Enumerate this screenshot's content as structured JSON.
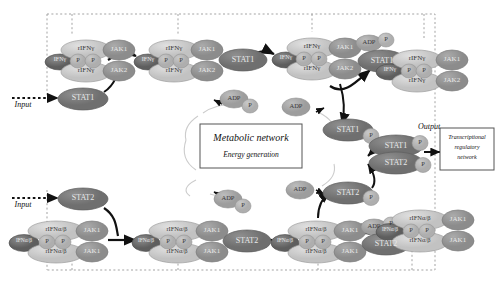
{
  "diagram": {
    "colors": {
      "ligand": "#6f6f6f",
      "receptor": "#cfcfcf",
      "jak": "#9a9a9a",
      "stat": "#808080",
      "phosphate": "#b8b8b8",
      "adp": "#a8a8a8",
      "arrow": "#111111",
      "dashed_boundary": "#9a9a9a",
      "box_border": "#555555",
      "thin_curve": "#c8c8c8"
    },
    "boundary_label": "cell-compartment-dashed-boundary"
  },
  "inputs": {
    "top": "Input",
    "bottom": "Input"
  },
  "output": {
    "label": "Output"
  },
  "metabolic_box": {
    "line1": "Metabolic network",
    "line2": "Energy generation"
  },
  "transcription_box": {
    "line1": "Transcriptional",
    "line2": "regulatory",
    "line3": "network"
  },
  "top_pathway": {
    "name": "interferon-gamma-pathway",
    "ligand": "IFNγ",
    "receptor": "rIFNγ",
    "kinase_upper": "JAK1",
    "kinase_lower": "JAK2",
    "phosphate": "P",
    "stat": "STAT1",
    "adp": "ADP",
    "complexes": [
      {
        "id": "complex-1",
        "ligand": "IFNγ",
        "receptor_top": "rIFNγ",
        "receptor_bottom": "rIFNγ",
        "jak_top": "JAK1",
        "jak_bottom": "JAK2",
        "p_left": "P",
        "p_right": "P",
        "stat": null,
        "adp": null
      },
      {
        "id": "complex-2",
        "ligand": "IFNγ",
        "receptor_top": "rIFNγ",
        "receptor_bottom": "rIFNγ",
        "jak_top": "JAK1",
        "jak_bottom": "JAK2",
        "p_left": "P",
        "p_right": "P",
        "stat": "STAT1",
        "adp": null
      },
      {
        "id": "complex-3",
        "ligand": "IFNγ",
        "receptor_top": "rIFNγ",
        "receptor_bottom": "rIFNγ",
        "jak_top": "JAK1",
        "jak_bottom": "JAK2",
        "p_left": "P",
        "p_right": "P",
        "stat": "STAT1",
        "adp": "ADP",
        "adp_p": "P"
      },
      {
        "id": "complex-4",
        "ligand": "IFNγ",
        "receptor_top": "rIFNγ",
        "receptor_bottom": "rIFNγ",
        "jak_top": "JAK1",
        "jak_bottom": "JAK2",
        "p_left": "P",
        "p_right": "P",
        "stat": null,
        "adp": null
      }
    ],
    "free_stat": "STAT1",
    "released_stat": "STAT1",
    "released_stat_p": "P",
    "adp_node_1": {
      "adp": "ADP",
      "p": "P"
    },
    "adp_node_2": {
      "adp": "ADP"
    }
  },
  "bottom_pathway": {
    "name": "interferon-alpha-beta-pathway",
    "ligand": "IFNα/β",
    "receptor": "rIFNα/β",
    "kinase_upper": "JAK1",
    "kinase_lower": "JAK1",
    "phosphate": "P",
    "stat": "STAT2",
    "adp": "ADP",
    "complexes": [
      {
        "id": "complex-1",
        "ligand": "IFNα/β",
        "receptor_top": "rIFNα/β",
        "receptor_bottom": "rIFNα/β",
        "jak_top": "JAK1",
        "jak_bottom": "JAK1",
        "p_left": "P",
        "p_right": "P",
        "stat": null,
        "adp": null
      },
      {
        "id": "complex-2",
        "ligand": "IFNα/β",
        "receptor_top": "rIFNα/β",
        "receptor_bottom": "rIFNα/β",
        "jak_top": "JAK1",
        "jak_bottom": "JAK1",
        "p_left": "P",
        "p_right": "P",
        "stat": "STAT2",
        "adp": null
      },
      {
        "id": "complex-3",
        "ligand": "IFNα/β",
        "receptor_top": "rIFNα/β",
        "receptor_bottom": "rIFNα/β",
        "jak_top": "JAK1",
        "jak_bottom": "JAK1",
        "p_left": "P",
        "p_right": "P",
        "stat": "STAT2",
        "adp": "ADP",
        "adp_p": "P"
      },
      {
        "id": "complex-4",
        "ligand": "IFNα/β",
        "receptor_top": "rIFNα/β",
        "receptor_bottom": "rIFNα/β",
        "jak_top": "JAK1",
        "jak_bottom": "JAK1",
        "p_left": "P",
        "p_right": "P",
        "stat": null,
        "adp": null
      }
    ],
    "free_stat": "STAT2",
    "released_stat": "STAT2",
    "released_stat_p": "P",
    "adp_node_1": {
      "adp": "ADP",
      "p": "P"
    },
    "adp_node_2": {
      "adp": "ADP"
    }
  },
  "dimer": {
    "name": "stat1-stat2-heterodimer",
    "top_stat": "STAT1",
    "top_p": "P",
    "bottom_stat": "STAT2",
    "bottom_p": "P"
  }
}
